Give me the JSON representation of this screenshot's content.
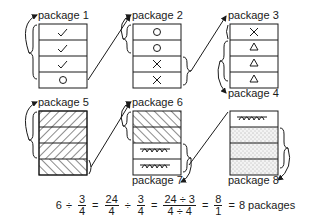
{
  "packages": [
    {
      "label": "package 1",
      "cells": [
        "check",
        "check",
        "check",
        "circle"
      ]
    },
    {
      "label": "package 2",
      "cells": [
        "circle",
        "circle",
        "cross",
        "cross"
      ]
    },
    {
      "label": "package 3",
      "cells": [
        "cross",
        "triangle",
        "triangle",
        "triangle"
      ]
    },
    {
      "label": "package 4"
    },
    {
      "label": "package 5",
      "cells": [
        "hatch-back",
        "hatch-back",
        "hatch-back",
        "hatch-fwd"
      ]
    },
    {
      "label": "package 6",
      "cells": [
        "hatch-fwd",
        "hatch-fwd",
        "loops",
        "loops"
      ]
    },
    {
      "label": "package 7"
    },
    {
      "label": "package 8",
      "cells": [
        "loops",
        "dots",
        "dots",
        "dots"
      ]
    }
  ],
  "equation": {
    "whole": "6",
    "div": "÷",
    "eq": "=",
    "f1": {
      "num": "3",
      "den": "4"
    },
    "f2": {
      "num": "24",
      "den": "4"
    },
    "f3": {
      "num": "3",
      "den": "4"
    },
    "f4": {
      "num": "24 ÷ 3",
      "den": "4 ÷ 4"
    },
    "f5": {
      "num": "8",
      "den": "1"
    },
    "result": "8 packages"
  }
}
